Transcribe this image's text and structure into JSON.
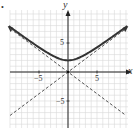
{
  "chart_data": {
    "type": "line",
    "title": "",
    "xlabel": "x",
    "ylabel": "y",
    "xlim": [
      -10,
      10
    ],
    "ylim": [
      -10,
      10
    ],
    "grid": true,
    "x_ticks": [
      "-5",
      "5"
    ],
    "y_ticks": [
      "5",
      "-5"
    ],
    "series": [
      {
        "name": "hyperbola upper branch",
        "style": "solid",
        "equation": "y = sqrt(4 + 0.5625 x^2)",
        "points": [
          [
            -10,
            7.76
          ],
          [
            -5,
            4.27
          ],
          [
            0,
            2
          ],
          [
            5,
            4.27
          ],
          [
            10,
            7.76
          ]
        ]
      },
      {
        "name": "asymptote 1",
        "style": "dashed",
        "equation": "y = 0.75x",
        "points": [
          [
            -10,
            -7.5
          ],
          [
            10,
            7.5
          ]
        ]
      },
      {
        "name": "asymptote 2",
        "style": "dashed",
        "equation": "y = -0.75x",
        "points": [
          [
            -10,
            7.5
          ],
          [
            10,
            -7.5
          ]
        ]
      }
    ]
  },
  "labels": {
    "bullet": "•",
    "x_axis": "x",
    "y_axis": "y",
    "x_neg5": "−5",
    "x_pos5": "5",
    "y_pos5": "5",
    "y_neg5": "−5"
  }
}
